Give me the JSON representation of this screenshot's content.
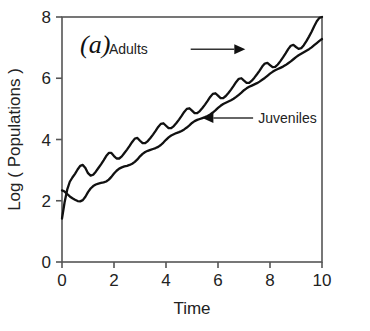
{
  "figure": {
    "panel_label": "(a)",
    "background_color": "#ffffff",
    "line_color": "#111111",
    "axis_color": "#555555"
  },
  "chart_data": {
    "type": "line",
    "title": "",
    "xlabel": "Time",
    "ylabel": "Log ( Populations )",
    "xlim": [
      0,
      10
    ],
    "ylim": [
      0,
      8
    ],
    "xticks": [
      0,
      2,
      4,
      6,
      8,
      10
    ],
    "yticks": [
      0,
      2,
      4,
      6,
      8
    ],
    "xtick_labels": [
      "0",
      "2",
      "4",
      "6",
      "8",
      "10"
    ],
    "ytick_labels": [
      "0",
      "2",
      "4",
      "6",
      "8"
    ],
    "grid": false,
    "legend_position": "inline-annotations",
    "oscillation_period": 1.0,
    "series": [
      {
        "name": "Adults",
        "color": "#111111",
        "x": [
          0.0,
          0.1,
          0.2,
          0.3,
          0.4,
          0.5,
          0.6,
          0.7,
          0.8,
          0.9,
          1.0,
          1.1,
          1.2,
          1.3,
          1.4,
          1.5,
          1.6,
          1.7,
          1.8,
          1.9,
          2.0,
          2.1,
          2.2,
          2.3,
          2.4,
          2.5,
          2.6,
          2.7,
          2.8,
          2.9,
          3.0,
          3.1,
          3.2,
          3.3,
          3.4,
          3.5,
          3.6,
          3.7,
          3.8,
          3.9,
          4.0,
          4.1,
          4.2,
          4.3,
          4.4,
          4.5,
          4.6,
          4.7,
          4.8,
          4.9,
          5.0,
          5.1,
          5.2,
          5.3,
          5.4,
          5.5,
          5.6,
          5.7,
          5.8,
          5.9,
          6.0,
          6.1,
          6.2,
          6.3,
          6.4,
          6.5,
          6.6,
          6.7,
          6.8,
          6.9,
          7.0,
          7.1,
          7.2,
          7.3,
          7.4,
          7.5,
          7.6,
          7.7,
          7.8,
          7.9,
          8.0,
          8.1,
          8.2,
          8.3,
          8.4,
          8.5,
          8.6,
          8.7,
          8.8,
          8.9,
          9.0,
          9.1,
          9.2,
          9.3,
          9.4,
          9.5,
          9.6,
          9.7,
          9.8,
          9.9,
          10.0
        ],
        "y": [
          1.42,
          1.95,
          2.36,
          2.62,
          2.76,
          2.88,
          3.02,
          3.14,
          3.17,
          3.07,
          2.9,
          2.82,
          2.85,
          2.95,
          3.07,
          3.19,
          3.32,
          3.46,
          3.56,
          3.56,
          3.46,
          3.38,
          3.38,
          3.45,
          3.56,
          3.67,
          3.79,
          3.92,
          4.03,
          4.05,
          3.96,
          3.88,
          3.88,
          3.95,
          4.05,
          4.16,
          4.28,
          4.41,
          4.51,
          4.53,
          4.45,
          4.37,
          4.37,
          4.44,
          4.54,
          4.65,
          4.77,
          4.9,
          5.0,
          5.02,
          4.94,
          4.86,
          4.86,
          4.93,
          5.03,
          5.14,
          5.26,
          5.39,
          5.49,
          5.51,
          5.43,
          5.35,
          5.35,
          5.42,
          5.52,
          5.63,
          5.75,
          5.88,
          5.98,
          6.0,
          5.92,
          5.85,
          5.85,
          5.92,
          6.02,
          6.13,
          6.25,
          6.38,
          6.48,
          6.5,
          6.43,
          6.36,
          6.37,
          6.45,
          6.56,
          6.68,
          6.81,
          6.95,
          7.06,
          7.09,
          7.02,
          6.96,
          6.98,
          7.08,
          7.21,
          7.36,
          7.52,
          7.7,
          7.86,
          7.97,
          8.0
        ]
      },
      {
        "name": "Juveniles",
        "color": "#111111",
        "x": [
          0.0,
          0.1,
          0.2,
          0.3,
          0.4,
          0.5,
          0.6,
          0.7,
          0.8,
          0.9,
          1.0,
          1.1,
          1.2,
          1.3,
          1.4,
          1.5,
          1.6,
          1.7,
          1.8,
          1.9,
          2.0,
          2.1,
          2.2,
          2.3,
          2.4,
          2.5,
          2.6,
          2.7,
          2.8,
          2.9,
          3.0,
          3.1,
          3.2,
          3.3,
          3.4,
          3.5,
          3.6,
          3.7,
          3.8,
          3.9,
          4.0,
          4.1,
          4.2,
          4.3,
          4.4,
          4.5,
          4.6,
          4.7,
          4.8,
          4.9,
          5.0,
          5.1,
          5.2,
          5.3,
          5.4,
          5.5,
          5.6,
          5.7,
          5.8,
          5.9,
          6.0,
          6.1,
          6.2,
          6.3,
          6.4,
          6.5,
          6.6,
          6.7,
          6.8,
          6.9,
          7.0,
          7.1,
          7.2,
          7.3,
          7.4,
          7.5,
          7.6,
          7.7,
          7.8,
          7.9,
          8.0,
          8.1,
          8.2,
          8.3,
          8.4,
          8.5,
          8.6,
          8.7,
          8.8,
          8.9,
          9.0,
          9.1,
          9.2,
          9.3,
          9.4,
          9.5,
          9.6,
          9.7,
          9.8,
          9.9,
          10.0
        ],
        "y": [
          2.34,
          2.3,
          2.22,
          2.14,
          2.08,
          2.03,
          1.99,
          1.98,
          2.02,
          2.13,
          2.28,
          2.4,
          2.48,
          2.53,
          2.56,
          2.58,
          2.6,
          2.63,
          2.69,
          2.78,
          2.89,
          2.98,
          3.05,
          3.09,
          3.12,
          3.14,
          3.17,
          3.21,
          3.27,
          3.35,
          3.45,
          3.53,
          3.59,
          3.63,
          3.66,
          3.69,
          3.72,
          3.76,
          3.82,
          3.9,
          3.99,
          4.07,
          4.13,
          4.17,
          4.21,
          4.24,
          4.28,
          4.33,
          4.39,
          4.46,
          4.54,
          4.6,
          4.64,
          4.67,
          4.7,
          4.73,
          4.77,
          4.82,
          4.88,
          4.95,
          5.03,
          5.1,
          5.16,
          5.2,
          5.24,
          5.28,
          5.33,
          5.39,
          5.46,
          5.53,
          5.61,
          5.67,
          5.72,
          5.76,
          5.8,
          5.84,
          5.89,
          5.95,
          6.01,
          6.08,
          6.15,
          6.21,
          6.26,
          6.3,
          6.34,
          6.38,
          6.43,
          6.49,
          6.55,
          6.62,
          6.69,
          6.75,
          6.8,
          6.85,
          6.9,
          6.95,
          7.01,
          7.08,
          7.15,
          7.22,
          7.28
        ]
      }
    ],
    "annotations": [
      {
        "text": "Adults",
        "label_x": 3.3,
        "label_y": 6.95,
        "arrow_from_x": 4.95,
        "arrow_from_y": 6.95,
        "arrow_to_x": 7.05,
        "arrow_to_y": 6.95,
        "direction": "right"
      },
      {
        "text": "Juveniles",
        "label_x": 7.55,
        "label_y": 4.7,
        "arrow_from_x": 7.35,
        "arrow_from_y": 4.7,
        "arrow_to_x": 5.4,
        "arrow_to_y": 4.7,
        "direction": "left"
      }
    ]
  }
}
